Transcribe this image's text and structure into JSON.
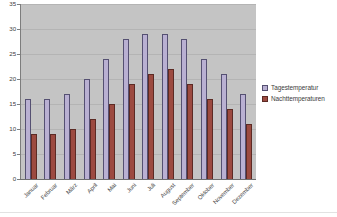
{
  "chart_data": {
    "type": "bar",
    "title": "",
    "subtitle": "",
    "xlabel": "",
    "ylabel": "",
    "categories": [
      "Januar",
      "Februar",
      "März",
      "April",
      "Mai",
      "Juni",
      "Juli",
      "August",
      "September",
      "Oktober",
      "November",
      "Dezember"
    ],
    "series": [
      {
        "name": "Tagestemperatur",
        "color": "#b9b0d2",
        "values": [
          16,
          16,
          17,
          20,
          24,
          28,
          29,
          29,
          28,
          24,
          21,
          17
        ]
      },
      {
        "name": "Nachttemperaturen",
        "color": "#9c4a40",
        "values": [
          9,
          9,
          10,
          12,
          15,
          19,
          21,
          22,
          19,
          16,
          14,
          11
        ]
      }
    ],
    "ylim": [
      0,
      35
    ],
    "ytick_step": 5,
    "yticks": [
      0,
      5,
      10,
      15,
      20,
      25,
      30,
      35
    ],
    "ytick_labels": [
      "0",
      "5",
      "10",
      "15",
      "20",
      "25",
      "30",
      "35"
    ],
    "grid": true,
    "grid_axis": "y",
    "legend_position": "right",
    "plot_background": "#c4c4c4",
    "figure_background": "#ffffff",
    "annotations": []
  },
  "legend": {
    "items": [
      {
        "label": "Tagestemperatur",
        "swatch": "legend-swatch-day"
      },
      {
        "label": "Nachttemperaturen",
        "swatch": "legend-swatch-night"
      }
    ]
  }
}
